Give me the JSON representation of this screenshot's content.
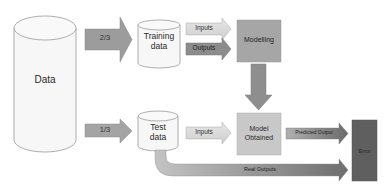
{
  "diagram": {
    "nodes": {
      "data": {
        "label": "Data",
        "shape": "cylinder",
        "fill": "#f7f7f7"
      },
      "training_data": {
        "label_line1": "Training",
        "label_line2": "data",
        "shape": "cylinder",
        "fill": "#f7f7f7"
      },
      "test_data": {
        "label_line1": "Test",
        "label_line2": "data",
        "shape": "cylinder",
        "fill": "#f7f7f7"
      },
      "modelling": {
        "label": "Modelling",
        "shape": "box",
        "fill": "#a6a6a6"
      },
      "model_obtained": {
        "label_line1": "Model",
        "label_line2": "Obtained",
        "shape": "box",
        "fill": "#c8c8c8"
      },
      "error": {
        "label": "Error",
        "shape": "box",
        "fill": "#5f5f5f"
      }
    },
    "arrows": {
      "split_train": {
        "label": "2/3",
        "fill": "#9c9c9c"
      },
      "split_test": {
        "label": "1/3",
        "fill": "#a4a4a4"
      },
      "train_inputs": {
        "label": "Inputs",
        "fill": "#dcdcdc"
      },
      "train_outputs": {
        "label": "Outputs",
        "fill": "#8c8c8c"
      },
      "model_down": {
        "fill": "#8e8e8e"
      },
      "test_inputs": {
        "label": "Inputs",
        "fill": "#d6d6d6"
      },
      "predicted_output": {
        "label": "Predicted Output",
        "fill_start": "#b0b0b0",
        "fill_end": "#6a6a6a"
      },
      "real_outputs": {
        "label": "Real Outputs",
        "fill_start": "#c4c4c4",
        "fill_end": "#6e6e6e"
      }
    }
  }
}
